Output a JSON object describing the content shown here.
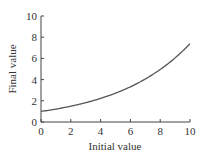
{
  "chart_data": {
    "type": "line",
    "title": "",
    "xlabel": "Initial value",
    "ylabel": "Final value",
    "xlim": [
      0,
      10
    ],
    "ylim": [
      0,
      10
    ],
    "xticks": [
      0,
      2,
      4,
      6,
      8,
      10
    ],
    "yticks": [
      0,
      2,
      4,
      6,
      8,
      10
    ],
    "grid": false,
    "legend": null,
    "series": [
      {
        "name": "Final value",
        "color": "#555555",
        "x": [
          0,
          1,
          2,
          3,
          4,
          5,
          6,
          7,
          8,
          9,
          10
        ],
        "y": [
          1.0,
          1.22,
          1.49,
          1.82,
          2.23,
          2.72,
          3.32,
          4.06,
          4.95,
          6.05,
          7.39
        ]
      }
    ]
  }
}
